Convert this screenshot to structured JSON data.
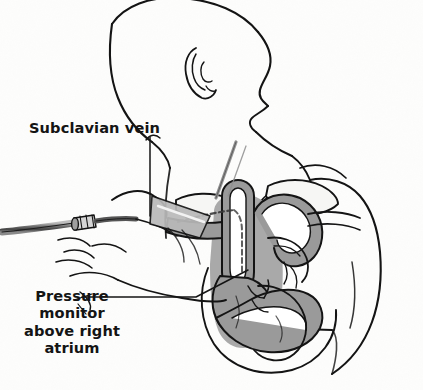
{
  "figure": {
    "background_color": "#fdfdfc",
    "line_color": "#141414",
    "tissue_fill": "#9a9a9a",
    "lumen_fill": "#ffffff",
    "bone_fill": "#f4f4f2"
  },
  "caption": {
    "partial_top_text": "catheter is removed."
  },
  "labels": {
    "subclavian_vein": "Subclavian vein",
    "pressure_monitor": {
      "line1": "Pressure",
      "line2": "monitor",
      "line3": "above right",
      "line4": "atrium"
    }
  },
  "anatomy": {
    "parts": [
      "head-profile",
      "ear",
      "neck",
      "shoulder",
      "clavicle",
      "first-rib",
      "subclavian-vein",
      "superior-vena-cava",
      "aortic-arch",
      "right-atrium",
      "right-ventricle",
      "left-ventricle",
      "pulmonary-artery",
      "chest-wall",
      "arm",
      "hand"
    ]
  },
  "devices": {
    "catheter_tube": "catheter",
    "catheter_hub": "luer-hub-connector",
    "guidewire": "guidewire",
    "insertion_needle": "needle"
  }
}
